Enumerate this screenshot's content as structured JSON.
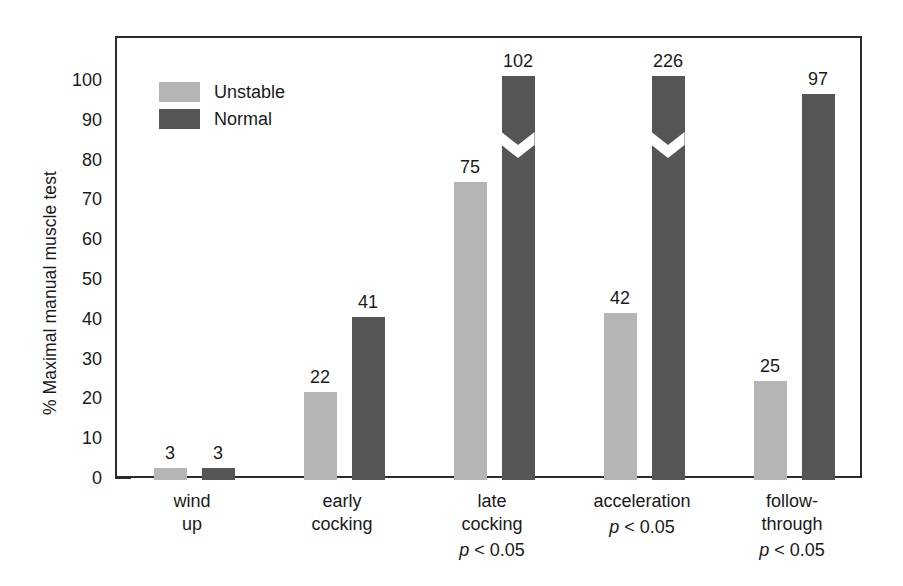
{
  "chart_data": {
    "type": "bar",
    "title": "",
    "xlabel": "",
    "ylabel": "% Maximal manual muscle test",
    "ylim": [
      0,
      105
    ],
    "ytick_values": [
      0,
      10,
      20,
      30,
      40,
      50,
      60,
      70,
      80,
      90,
      100
    ],
    "ytick_labels": [
      "0",
      "10",
      "20",
      "30",
      "40",
      "50",
      "60",
      "70",
      "80",
      "90",
      "100"
    ],
    "grid": false,
    "legend_position": "upper-left-inside",
    "categories": [
      "wind\nup",
      "early\ncocking",
      "late\ncocking",
      "acceleration",
      "follow-\nthrough"
    ],
    "category_annotations": [
      "",
      "",
      "p < 0.05",
      "p < 0.05",
      "p < 0.05"
    ],
    "series": [
      {
        "name": "Unstable",
        "color": "#b5b5b5",
        "values": [
          3,
          22,
          75,
          42,
          25
        ],
        "labels": [
          "3",
          "22",
          "75",
          "42",
          "25"
        ],
        "broken": [
          false,
          false,
          false,
          false,
          false
        ]
      },
      {
        "name": "Normal",
        "color": "#555555",
        "values": [
          3,
          41,
          102,
          226,
          97
        ],
        "labels": [
          "3",
          "41",
          "102",
          "226",
          "97"
        ],
        "broken": [
          false,
          false,
          true,
          true,
          false
        ]
      }
    ]
  },
  "legend": {
    "items": [
      {
        "label": "Unstable",
        "color": "#b5b5b5"
      },
      {
        "label": "Normal",
        "color": "#555555"
      }
    ]
  },
  "axis": {
    "y_title": "% Maximal manual muscle test"
  },
  "colors": {
    "unstable": "#b5b5b5",
    "normal": "#555555",
    "frame": "#2b2b2b",
    "text": "#1a1a1a",
    "background": "#ffffff"
  }
}
